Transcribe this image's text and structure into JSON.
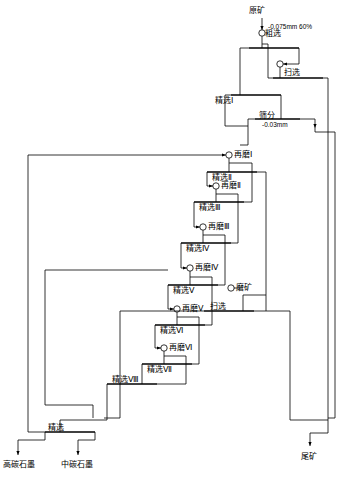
{
  "diagram": {
    "feed": {
      "ore_label": "原矿",
      "fineness_label": "-0.075mm 60%"
    },
    "nodes": [
      {
        "id": "rough",
        "label": "粗选"
      },
      {
        "id": "scav1",
        "label": "扫选"
      },
      {
        "id": "clean1",
        "label": "精选Ⅰ"
      },
      {
        "id": "screen",
        "label": "筛分"
      },
      {
        "id": "screen_size",
        "label": "-0.03mm"
      },
      {
        "id": "regrind1",
        "label": "再磨Ⅰ"
      },
      {
        "id": "clean2",
        "label": "精选Ⅱ"
      },
      {
        "id": "regrind2",
        "label": "再磨Ⅱ"
      },
      {
        "id": "clean3",
        "label": "精选Ⅲ"
      },
      {
        "id": "regrind3",
        "label": "再磨Ⅲ"
      },
      {
        "id": "clean4",
        "label": "精选Ⅳ"
      },
      {
        "id": "regrind4",
        "label": "再磨Ⅳ"
      },
      {
        "id": "clean5",
        "label": "精选Ⅴ"
      },
      {
        "id": "regrind5",
        "label": "再磨Ⅴ"
      },
      {
        "id": "clean6",
        "label": "精选Ⅵ"
      },
      {
        "id": "regrind6",
        "label": "再磨Ⅵ"
      },
      {
        "id": "clean7",
        "label": "精选Ⅶ"
      },
      {
        "id": "clean8",
        "label": "精选Ⅷ"
      },
      {
        "id": "scav2",
        "label": "扫选"
      },
      {
        "id": "grind",
        "label": "磨矿"
      },
      {
        "id": "final_clean",
        "label": "精选"
      }
    ],
    "products": {
      "high_carbon": "高碳石墨",
      "mid_carbon": "中碳石墨",
      "tailings": "尾矿"
    }
  }
}
